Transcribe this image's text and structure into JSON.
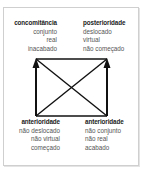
{
  "diagram": {
    "type": "semiotic-square",
    "nodes": {
      "top_left": {
        "title": "concomitância",
        "items": [
          "conjunto",
          "real",
          "inacabado"
        ]
      },
      "top_right": {
        "title": "posterioridade",
        "items": [
          "deslocado",
          "virtual",
          "não começado"
        ]
      },
      "bottom_left": {
        "title": "anterioridade",
        "items": [
          "não deslocado",
          "não virtual",
          "começado"
        ]
      },
      "bottom_right": {
        "title": "anterioridade",
        "items": [
          "não conjunto",
          "não real",
          "acabado"
        ]
      }
    },
    "edges": [
      {
        "from": "bottom_left",
        "to": "top_left",
        "style": "arrow"
      },
      {
        "from": "bottom_right",
        "to": "top_right",
        "style": "arrow"
      },
      {
        "from": "top_left",
        "to": "top_right",
        "style": "line"
      },
      {
        "from": "bottom_left",
        "to": "bottom_right",
        "style": "line"
      },
      {
        "from": "top_left",
        "to": "bottom_right",
        "style": "line"
      },
      {
        "from": "top_right",
        "to": "bottom_left",
        "style": "line"
      }
    ],
    "colors": {
      "line": "#111111",
      "border": "#cfcfcf",
      "title_text": "#222222",
      "item_text": "#555555"
    }
  }
}
